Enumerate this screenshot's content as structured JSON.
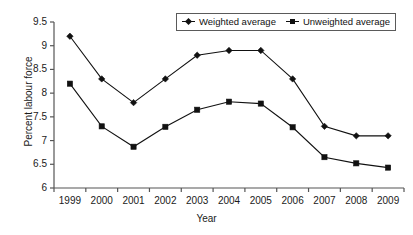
{
  "chart_data": {
    "type": "line",
    "title": "",
    "xlabel": "Year",
    "ylabel": "Percent labour force",
    "categories": [
      "1999",
      "2000",
      "2001",
      "2002",
      "2003",
      "2004",
      "2005",
      "2006",
      "2007",
      "2008",
      "2009"
    ],
    "x": [
      1999,
      2000,
      2001,
      2002,
      2003,
      2004,
      2005,
      2006,
      2007,
      2008,
      2009
    ],
    "series": [
      {
        "name": "Weighted average",
        "marker": "diamond",
        "color": "#111111",
        "values": [
          9.2,
          8.3,
          7.8,
          8.3,
          8.8,
          8.9,
          8.9,
          8.3,
          7.3,
          7.1,
          7.1
        ]
      },
      {
        "name": "Unweighted average",
        "marker": "square",
        "color": "#111111",
        "values": [
          8.2,
          7.3,
          6.87,
          7.29,
          7.65,
          7.82,
          7.78,
          7.28,
          6.65,
          6.52,
          6.43
        ]
      }
    ],
    "ylim": [
      6,
      9.5
    ],
    "ytick_step": 0.5,
    "yticks": [
      "9.5",
      "9",
      "8.5",
      "8",
      "7.5",
      "7",
      "6.5",
      "6"
    ],
    "ytick_values": [
      9.5,
      9,
      8.5,
      8,
      7.5,
      7,
      6.5,
      6
    ],
    "xlim": [
      1998.5,
      2009.5
    ],
    "grid": false,
    "legend_position": "top-right",
    "legend_entries": [
      "Weighted average",
      "Unweighted average"
    ]
  },
  "axes": {
    "line_color": "#555555"
  }
}
